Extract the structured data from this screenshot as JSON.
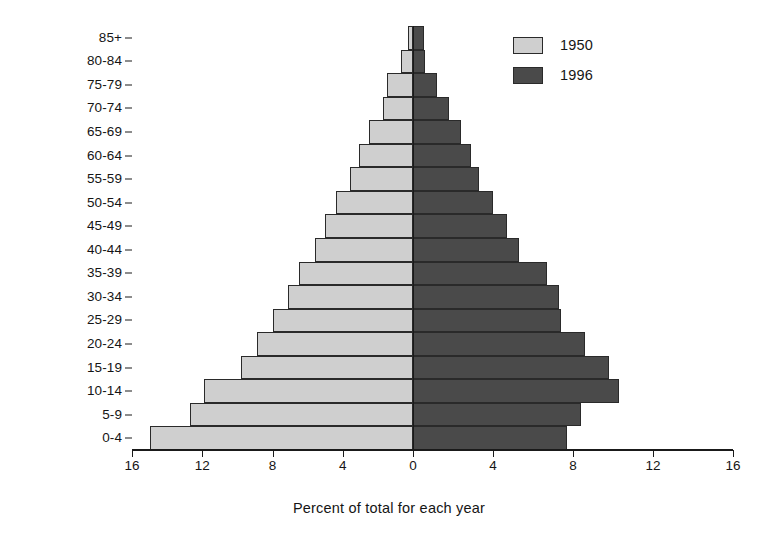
{
  "chart_data": {
    "type": "bar",
    "subtype": "population-pyramid",
    "title": "",
    "xlabel": "Percent of total for each year",
    "ylabel": "",
    "orientation": "horizontal",
    "grid": false,
    "legend_position": "top-right",
    "categories": [
      "0-4",
      "5-9",
      "10-14",
      "15-19",
      "20-24",
      "25-29",
      "30-34",
      "35-39",
      "40-44",
      "45-49",
      "50-54",
      "55-59",
      "60-64",
      "65-69",
      "70-74",
      "75-79",
      "80-84",
      "85+"
    ],
    "axis": {
      "left_ticks": [
        16,
        12,
        8,
        4,
        0
      ],
      "right_ticks": [
        0,
        4,
        8,
        12,
        16
      ],
      "tick_labels": [
        "16",
        "12",
        "8",
        "4",
        "0",
        "4",
        "8",
        "12",
        "16"
      ],
      "max": 16,
      "min": 0,
      "units": "percent"
    },
    "series": [
      {
        "name": "1950",
        "side": "left",
        "color": "#cfcfcf",
        "values": [
          15.0,
          12.7,
          11.9,
          9.8,
          8.9,
          8.0,
          7.1,
          6.5,
          5.6,
          5.0,
          4.4,
          3.6,
          3.1,
          2.5,
          1.7,
          1.5,
          0.7,
          0.3
        ]
      },
      {
        "name": "1996",
        "side": "right",
        "color": "#4a4a4a",
        "values": [
          7.7,
          8.4,
          10.3,
          9.8,
          8.6,
          7.4,
          7.3,
          6.7,
          5.3,
          4.7,
          4.0,
          3.3,
          2.9,
          2.4,
          1.8,
          1.2,
          0.6,
          0.55
        ]
      }
    ]
  },
  "legend": {
    "entries": [
      {
        "label": "1950",
        "color": "#cfcfcf"
      },
      {
        "label": "1996",
        "color": "#4a4a4a"
      }
    ]
  },
  "xaxis_title": "Percent of total for each year"
}
